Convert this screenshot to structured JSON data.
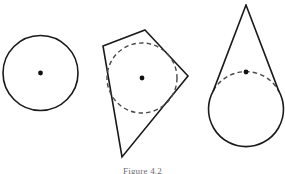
{
  "figure": {
    "caption": "Figure 4.2",
    "background_color": "#ffffff",
    "stroke_color": "#1a1a1a",
    "dashed_color": "#4a4a4a",
    "dot_color": "#111111",
    "width": 285,
    "height": 174
  },
  "shapes": {
    "circle_plain": {
      "label": "circle",
      "cx": 40.5,
      "cy": 73,
      "r": 37.5,
      "dot_r": 2.4
    },
    "kite_with_incircle": {
      "label": "kite with inscribed circle",
      "polygon_points": "145,30 188,76 122,157 103,46",
      "vertices": [
        {
          "name": "top",
          "x": 145,
          "y": 30
        },
        {
          "name": "right",
          "x": 188,
          "y": 76
        },
        {
          "name": "bottom",
          "x": 122,
          "y": 157
        },
        {
          "name": "left",
          "x": 103,
          "y": 46
        }
      ],
      "incircle": {
        "cx": 142,
        "cy": 78,
        "r": 35
      },
      "dot_r": 2.4
    },
    "cone_on_circle": {
      "label": "circle with tangent cone",
      "circle": {
        "cx": 246,
        "cy": 72,
        "r": 37.5
      },
      "apex": {
        "x": 246,
        "y": 5
      },
      "visible_arc_path": "M 213.4 90.6 A 37.5 37.5 0 1 0 278.6 90.6",
      "hidden_arc_path": "M 213.4 90.6 A 37.5 37.5 0 0 1 278.6 90.6",
      "cone_left_path": "M 246 5 L 213.4 90.6",
      "cone_right_path": "M 246 5 L 278.6 90.6",
      "cone_outline_path": "M 213.4 53.4 L 246 5 L 278.6 53.4",
      "dot_r": 2.4
    }
  }
}
